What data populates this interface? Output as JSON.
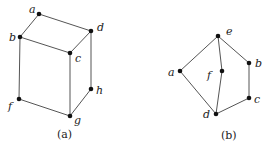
{
  "figures": [
    {
      "id": "a",
      "caption": "(a)",
      "caption_pos": [
        57,
        138
      ],
      "nodes": [
        {
          "name": "a",
          "x": 39,
          "y": 14,
          "lx": 29,
          "ly": 13
        },
        {
          "name": "d",
          "x": 91,
          "y": 31,
          "lx": 97,
          "ly": 31
        },
        {
          "name": "b",
          "x": 20,
          "y": 37,
          "lx": 9,
          "ly": 41
        },
        {
          "name": "c",
          "x": 70,
          "y": 53,
          "lx": 75,
          "ly": 62
        },
        {
          "name": "f",
          "x": 19,
          "y": 99,
          "lx": 8,
          "ly": 110
        },
        {
          "name": "g",
          "x": 70,
          "y": 116,
          "lx": 74,
          "ly": 124
        },
        {
          "name": "h",
          "x": 91,
          "y": 89,
          "lx": 96,
          "ly": 94
        }
      ],
      "edges": [
        [
          "a",
          "d"
        ],
        [
          "a",
          "b"
        ],
        [
          "b",
          "c"
        ],
        [
          "d",
          "c"
        ],
        [
          "b",
          "f"
        ],
        [
          "c",
          "g"
        ],
        [
          "d",
          "h"
        ],
        [
          "f",
          "g"
        ],
        [
          "g",
          "h"
        ]
      ]
    },
    {
      "id": "b",
      "caption": "(b)",
      "caption_pos": [
        221,
        139
      ],
      "nodes": [
        {
          "name": "e",
          "x": 218,
          "y": 36,
          "lx": 226,
          "ly": 35
        },
        {
          "name": "a",
          "x": 180,
          "y": 71,
          "lx": 168,
          "ly": 76
        },
        {
          "name": "f",
          "x": 222,
          "y": 71,
          "lx": 207,
          "ly": 79
        },
        {
          "name": "b",
          "x": 249,
          "y": 63,
          "lx": 255,
          "ly": 67
        },
        {
          "name": "c",
          "x": 249,
          "y": 98,
          "lx": 254,
          "ly": 103
        },
        {
          "name": "d",
          "x": 216,
          "y": 114,
          "lx": 203,
          "ly": 118
        }
      ],
      "edges": [
        [
          "e",
          "a"
        ],
        [
          "e",
          "f"
        ],
        [
          "e",
          "b"
        ],
        [
          "b",
          "c"
        ],
        [
          "c",
          "d"
        ],
        [
          "a",
          "d"
        ],
        [
          "f",
          "d"
        ]
      ]
    }
  ]
}
